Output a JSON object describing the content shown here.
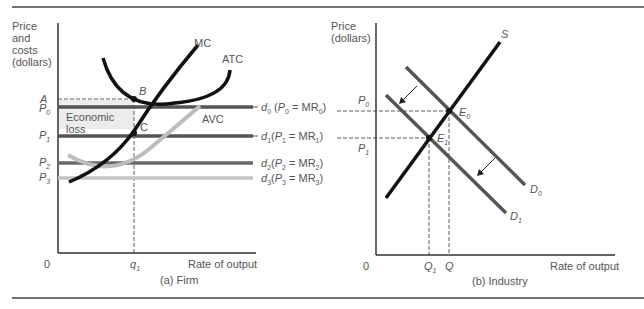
{
  "figure": {
    "panel_a": {
      "caption": "(a) Firm",
      "y_axis_label": [
        "Price",
        "and",
        "costs",
        "(dollars)"
      ],
      "x_axis_label": "Rate of output",
      "origin": "0",
      "y_ticks": [
        "A",
        "P0",
        "P1",
        "P2",
        "P3"
      ],
      "x_ticks": [
        "q1"
      ],
      "curve_labels": {
        "mc": "MC",
        "atc": "ATC",
        "avc": "AVC"
      },
      "points": {
        "b": "B",
        "c": "C"
      },
      "region_label": [
        "Economic",
        "loss"
      ],
      "demand_lines": [
        {
          "name": "d0",
          "label": "d0 (P0 = MR0)"
        },
        {
          "name": "d1",
          "label": "d1(P1 = MR1)"
        },
        {
          "name": "d2",
          "label": "d2(P2 = MR2)"
        },
        {
          "name": "d3",
          "label": "d3(P3 = MR3)"
        }
      ]
    },
    "panel_b": {
      "caption": "(b) Industry",
      "y_axis_label": [
        "Price",
        "(dollars)"
      ],
      "x_axis_label": "Rate of output",
      "origin": "0",
      "y_ticks": [
        "P0",
        "P1"
      ],
      "x_ticks": [
        "Q1",
        "Q"
      ],
      "curve_labels": {
        "s": "S",
        "d0": "D0",
        "d1": "D1"
      },
      "points": {
        "e0": "E0",
        "e1": "E1"
      }
    },
    "colors": {
      "curve_black": "#111111",
      "line_dark_gray": "#555555",
      "line_mid_gray": "#6a6a6a",
      "line_light_gray": "#c4c4c4",
      "loss_shade": "#ececec",
      "text": "#555555",
      "rule": "#444444"
    }
  }
}
